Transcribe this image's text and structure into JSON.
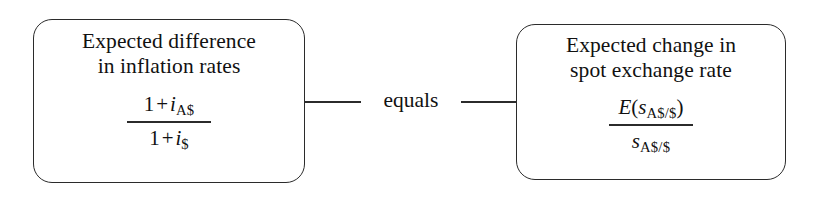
{
  "diagram": {
    "type": "relationship",
    "orientation": "horizontal",
    "connector": {
      "label": "equals",
      "style": "solid-line",
      "color": "#2b2b2b"
    },
    "nodes": [
      {
        "id": "expected-inflation-difference",
        "title_line_1": "Expected difference",
        "title_line_2": "in inflation rates",
        "formula": {
          "numerator": {
            "one": "1",
            "operator": "+",
            "symbol": "i",
            "subscript": "A$"
          },
          "denominator": {
            "one": "1",
            "operator": "+",
            "symbol": "i",
            "subscript": "$"
          },
          "plain": "(1 + i_A$) / (1 + i_$)"
        }
      },
      {
        "id": "expected-spot-rate-change",
        "title_line_1": "Expected change in",
        "title_line_2": "spot exchange rate",
        "formula": {
          "numerator": {
            "function": "E",
            "open_paren": "(",
            "symbol": "s",
            "subscript": "A$/$",
            "close_paren": ")"
          },
          "denominator": {
            "symbol": "s",
            "subscript": "A$/$"
          },
          "plain": "E(s_A$/$) / s_A$/$"
        }
      }
    ],
    "colors": {
      "stroke": "#2b2b2b",
      "text": "#111111",
      "background": "#ffffff"
    }
  }
}
